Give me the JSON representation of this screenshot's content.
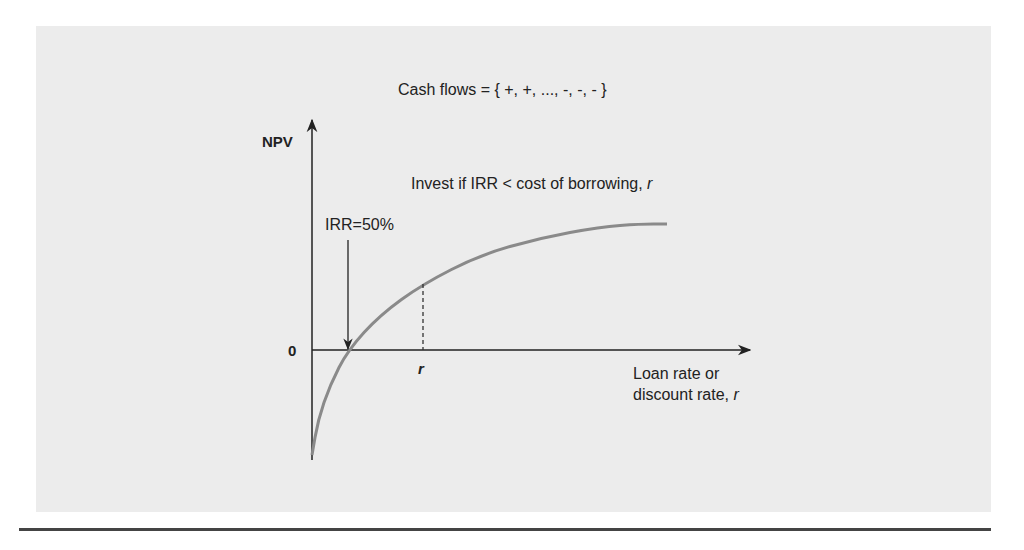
{
  "figure": {
    "title": "Cash flows = { +, +, ..., -, -, - }",
    "rule_text": "Invest if IRR < cost of borrowing, ",
    "rule_var": "r",
    "y_axis_label": "NPV",
    "zero_label": "0",
    "irr_label": "IRR=50%",
    "r_tick_label": "r",
    "x_axis_label_line1": "Loan rate or",
    "x_axis_label_line2": "discount rate, ",
    "x_axis_label_var": "r",
    "colors": {
      "curve": "#8a8a8a",
      "axes": "#222222",
      "panel": "#ececec"
    }
  },
  "chart_data": {
    "type": "line",
    "title": "Cash flows = { +, +, ..., -, -, - }",
    "xlabel": "Loan rate or discount rate, r",
    "ylabel": "NPV",
    "series": [
      {
        "name": "NPV",
        "x": [
          0.0,
          0.05,
          0.15,
          0.3,
          0.5,
          0.8,
          1.0
        ],
        "y": [
          -1.0,
          -0.45,
          0.0,
          0.55,
          0.85,
          1.05,
          1.1
        ]
      }
    ],
    "annotations": [
      {
        "text": "IRR=50%",
        "x": 0.15,
        "y": 0
      },
      {
        "text": "r",
        "x": 0.3,
        "y": 0.55,
        "style": "dashed-drop"
      }
    ],
    "xlim": [
      0,
      1.25
    ],
    "ylim": [
      -1.0,
      1.8
    ],
    "grid": false
  }
}
